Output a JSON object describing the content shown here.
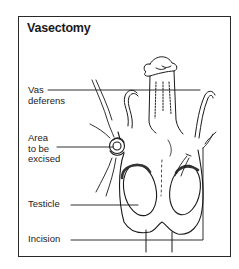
{
  "diagram": {
    "title": "Vasectomy",
    "labels": [
      {
        "id": "vas-deferens",
        "lines": [
          "Vas",
          "deferens"
        ]
      },
      {
        "id": "area-excised",
        "lines": [
          "Area",
          "to be",
          "excised"
        ]
      },
      {
        "id": "testicle",
        "lines": [
          "Testicle"
        ]
      },
      {
        "id": "incision",
        "lines": [
          "Incision"
        ]
      }
    ],
    "colors": {
      "ink": "#1a1a1a",
      "background": "#ffffff",
      "frame": "#2a2a2a"
    }
  }
}
